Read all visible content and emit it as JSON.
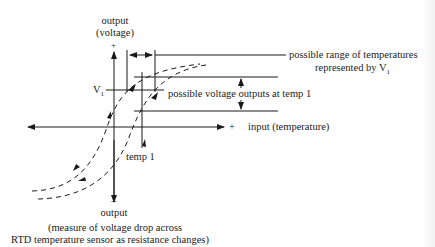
{
  "diagram": {
    "colors": {
      "line": "#1a1a1a",
      "text": "#222222",
      "background": "#ffffff"
    },
    "labels": {
      "y_top_line1": "output",
      "y_top_line2": "(voltage)",
      "y_top_sign": "+",
      "y_bottom_sign": "−",
      "y_bottom": "output",
      "caption_line1": "(measure of voltage drop across",
      "caption_line2": "RTD temperature sensor as resistance changes)",
      "x_plus": "+",
      "x_label": "input (temperature)",
      "v1": "V",
      "v1_sub": "1",
      "temp1": "temp 1",
      "range_line1": "possible range of temperatures",
      "range_line2": "represented by V",
      "range_sub": "1",
      "voltage_outputs": "possible voltage outputs at temp 1"
    },
    "icons": [
      "arrowhead-up",
      "arrowhead-down",
      "arrowhead-left",
      "arrowhead-right",
      "dashed-hysteresis-curve"
    ]
  }
}
